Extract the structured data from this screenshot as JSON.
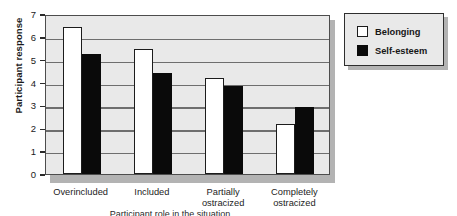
{
  "chart_data": {
    "type": "bar",
    "title": "",
    "xlabel": "",
    "ylabel": "Participant response",
    "ylim": [
      0,
      7
    ],
    "yticks": [
      0,
      1,
      2,
      3,
      4,
      5,
      6,
      7
    ],
    "ytick_labels": [
      "0",
      "1",
      "2",
      "3",
      "4",
      "5",
      "6",
      "7"
    ],
    "grid": true,
    "legend_position": "right-outside",
    "categories": [
      "Overincluded",
      "Included",
      "Partially ostracized",
      "Completely ostracized"
    ],
    "category_lines": [
      [
        "Overincluded"
      ],
      [
        "Included"
      ],
      [
        "Partially",
        "ostracized"
      ],
      [
        "Completely",
        "ostracized"
      ]
    ],
    "series": [
      {
        "name": "Belonging",
        "color": "#ffffff",
        "edge_color": "#1c1c1c",
        "values": [
          6.45,
          5.45,
          4.2,
          2.2
        ]
      },
      {
        "name": "Self-esteem",
        "color": "#0a0a0a",
        "edge_color": "#0a0a0a",
        "values": [
          5.25,
          4.4,
          3.85,
          2.95
        ]
      }
    ]
  },
  "colors": {
    "plot_background": "#e9e9e9",
    "plot_border": "#4d4d4d",
    "gridline": "#6e6e6e",
    "shadow": "#b3b3b3",
    "page_background": "#ffffff",
    "text": "#1a1a1a"
  },
  "axis": {
    "y_title": "Participant response"
  },
  "legend": {
    "items": [
      {
        "label": "Belonging",
        "swatch": "belonging"
      },
      {
        "label": "Self-esteem",
        "swatch": "selfesteem"
      }
    ]
  },
  "caption": {
    "clipped_text": "Participant role in the situation"
  }
}
